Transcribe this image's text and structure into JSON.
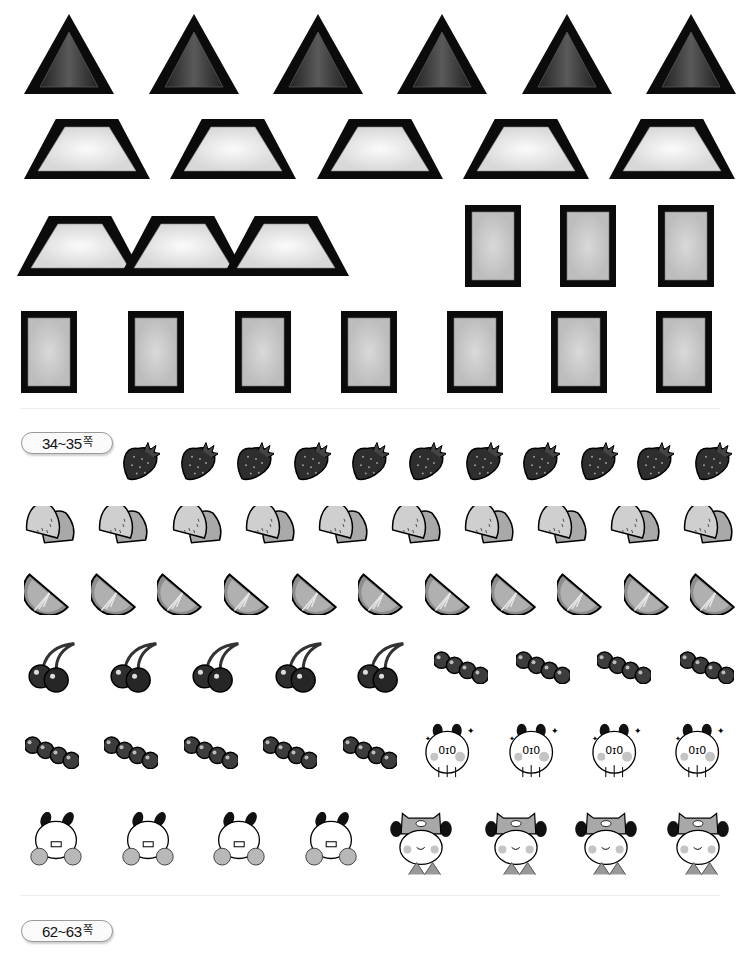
{
  "sheet": {
    "section_labels": [
      {
        "text": "34~35",
        "suffix": "쪽",
        "x": 21,
        "y": 432
      },
      {
        "text": "62~63",
        "suffix": "쪽",
        "x": 21,
        "y": 920
      }
    ],
    "rows": [
      {
        "name": "triangles",
        "kind": "triangle",
        "y": 12,
        "h": 84,
        "w": 94,
        "xs": [
          22,
          147,
          271,
          395,
          520,
          644
        ]
      },
      {
        "name": "trapezoids-row-1",
        "kind": "trapezoid",
        "y": 117,
        "h": 64,
        "w": 130,
        "xs": [
          22,
          168,
          315,
          461,
          607
        ]
      },
      {
        "name": "trapezoids-row-2",
        "kind": "trapezoid",
        "y": 214,
        "h": 64,
        "w": 130,
        "xs": [
          15,
          118,
          221
        ]
      },
      {
        "name": "squares-row-1",
        "kind": "square",
        "y": 204,
        "h": 84,
        "w": 58,
        "xs": [
          464,
          559,
          657
        ]
      },
      {
        "name": "squares-row-2",
        "kind": "square",
        "y": 310,
        "h": 84,
        "w": 58,
        "xs": [
          20,
          127,
          234,
          340,
          446,
          550,
          655
        ]
      },
      {
        "name": "strawberries",
        "kind": "strawberry",
        "y": 440,
        "h": 42,
        "w": 40,
        "xs": [
          120,
          178,
          234,
          291,
          349,
          406,
          463,
          520,
          578,
          634,
          692
        ]
      },
      {
        "name": "kiwis",
        "kind": "kiwi",
        "y": 506,
        "h": 40,
        "w": 54,
        "xs": [
          24,
          97,
          171,
          244,
          317,
          390,
          463,
          536,
          609,
          682
        ]
      },
      {
        "name": "lime-slices",
        "kind": "lime",
        "y": 571,
        "h": 44,
        "w": 46,
        "xs": [
          24,
          91,
          157,
          224,
          292,
          358,
          425,
          491,
          557,
          624,
          690
        ]
      },
      {
        "name": "cherries",
        "kind": "cherry",
        "y": 641,
        "h": 52,
        "w": 52,
        "xs": [
          25,
          107,
          189,
          272,
          354
        ]
      },
      {
        "name": "bead-strings-row-1",
        "kind": "beads",
        "y": 650,
        "h": 34,
        "w": 54,
        "xs": [
          434,
          516,
          597,
          680
        ]
      },
      {
        "name": "bead-strings-row-2",
        "kind": "beads",
        "y": 735,
        "h": 34,
        "w": 54,
        "xs": [
          25,
          104,
          184,
          263,
          343
        ]
      },
      {
        "name": "panda-sparkle",
        "kind": "panda-sparkle",
        "y": 722,
        "h": 58,
        "w": 56,
        "xs": [
          422,
          506,
          589,
          672
        ]
      },
      {
        "name": "panda-cheer",
        "kind": "panda-cheer",
        "y": 812,
        "h": 62,
        "w": 60,
        "xs": [
          26,
          118,
          209,
          301
        ]
      },
      {
        "name": "panda-hat",
        "kind": "panda-hat",
        "y": 810,
        "h": 68,
        "w": 62,
        "xs": [
          390,
          485,
          575,
          667
        ]
      }
    ]
  },
  "colors": {
    "outline": "#0b0b0b",
    "triangle_fill": "#3a3a3a",
    "trapezoid_fill": "#eeeeee",
    "square_fill": "#cdcdcd",
    "fruit_dark": "#2e2e2e",
    "fruit_light": "#b5b5b5",
    "panda_cheek": "#c4c4c4"
  }
}
